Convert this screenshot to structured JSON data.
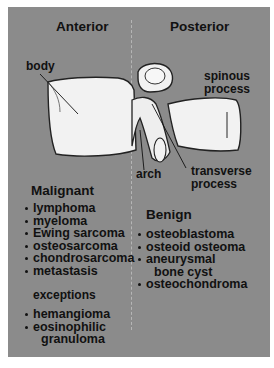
{
  "diagram": {
    "background_color": "#8b8b8b",
    "bone_color": "#f2f2f2",
    "headers": {
      "anterior": "Anterior",
      "posterior": "Posterior"
    },
    "anatomy_labels": {
      "body": "body",
      "spinous_process_line1": "spinous",
      "spinous_process_line2": "process",
      "arch": "arch",
      "transverse_process_line1": "transverse",
      "transverse_process_line2": "process"
    },
    "malignant": {
      "title": "Malignant",
      "items": [
        {
          "text": "lymphoma"
        },
        {
          "text": "myeloma"
        },
        {
          "text": "Ewing sarcoma"
        },
        {
          "text": "osteosarcoma"
        },
        {
          "text": "chondrosarcoma"
        },
        {
          "text": "metastasis"
        }
      ]
    },
    "exceptions": {
      "title": "exceptions",
      "items": [
        {
          "text": "hemangioma"
        },
        {
          "text": "eosinophilic",
          "continuation": "granuloma"
        }
      ]
    },
    "benign": {
      "title": "Benign",
      "items": [
        {
          "text": "osteoblastoma"
        },
        {
          "text": "osteoid osteoma"
        },
        {
          "text": "aneurysmal",
          "continuation": "bone cyst"
        },
        {
          "text": "osteochondroma"
        }
      ]
    }
  }
}
